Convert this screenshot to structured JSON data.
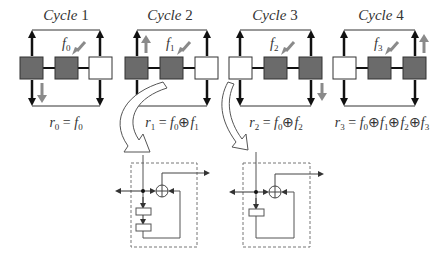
{
  "figure": {
    "cycles": [
      {
        "title_word": "Cycle",
        "title_num": "1",
        "input_label": "f",
        "input_sub": "0",
        "boxes": [
          "dark",
          "dark",
          "white"
        ],
        "input_box": 1,
        "shift": {
          "direction": "down",
          "position": "left"
        },
        "formula": {
          "lhs": "r",
          "lhs_sub": "0",
          "eq": "=",
          "terms": [
            {
              "v": "f",
              "s": "0"
            }
          ]
        }
      },
      {
        "title_word": "Cycle",
        "title_num": "2",
        "input_label": "f",
        "input_sub": "1",
        "boxes": [
          "dark",
          "dark",
          "white"
        ],
        "input_box": 1,
        "shift": {
          "direction": "up",
          "position": "left"
        },
        "formula": {
          "lhs": "r",
          "lhs_sub": "1",
          "eq": "=",
          "terms": [
            {
              "v": "f",
              "s": "0"
            },
            {
              "v": "f",
              "s": "1"
            }
          ]
        }
      },
      {
        "title_word": "Cycle",
        "title_num": "3",
        "input_label": "f",
        "input_sub": "2",
        "boxes": [
          "white",
          "dark",
          "dark"
        ],
        "input_box": 1,
        "shift": {
          "direction": "down",
          "position": "right"
        },
        "formula": {
          "lhs": "r",
          "lhs_sub": "2",
          "eq": "=",
          "terms": [
            {
              "v": "f",
              "s": "0"
            },
            {
              "v": "f",
              "s": "2"
            }
          ]
        }
      },
      {
        "title_word": "Cycle",
        "title_num": "4",
        "input_label": "f",
        "input_sub": "3",
        "boxes": [
          "white",
          "dark",
          "dark"
        ],
        "input_box": 1,
        "shift": {
          "direction": "up",
          "position": "right"
        },
        "formula": {
          "lhs": "r",
          "lhs_sub": "3",
          "eq": "=",
          "terms": [
            {
              "v": "f",
              "s": "0"
            },
            {
              "v": "f",
              "s": "1"
            },
            {
              "v": "f",
              "s": "2"
            },
            {
              "v": "f",
              "s": "3"
            }
          ]
        }
      }
    ],
    "circuits": [
      {
        "name": "two-register-xor-circuit",
        "registers": 2
      },
      {
        "name": "one-register-xor-circuit",
        "registers": 1
      }
    ],
    "xor_symbol": "⊕",
    "colors": {
      "dark_box": "#6b6b6b",
      "white_box": "#ffffff",
      "line": "#111111",
      "shift_arrow": "#8a8a8a",
      "circuit_line": "#555555",
      "dashed": "#777777"
    }
  }
}
